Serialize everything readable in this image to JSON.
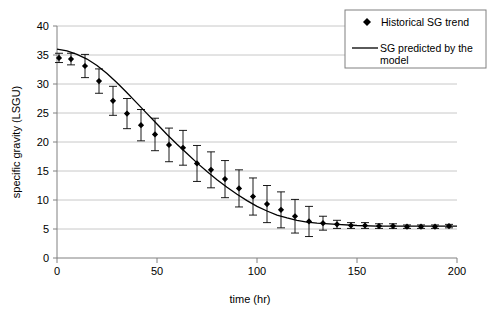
{
  "chart_data": {
    "type": "scatter",
    "title": "",
    "xlabel": "time (hr)",
    "ylabel": "specific gravity (LSGU)",
    "xlim": [
      0,
      200
    ],
    "ylim": [
      0,
      40
    ],
    "xticks": [
      0,
      50,
      100,
      150,
      200
    ],
    "yticks": [
      0,
      5,
      10,
      15,
      20,
      25,
      30,
      35,
      40
    ],
    "grid": "horizontal",
    "legend_position": "top-right",
    "series": [
      {
        "name": "Historical SG trend",
        "type": "scatter-with-errorbars",
        "marker": "diamond",
        "color": "#000000",
        "x": [
          1,
          7,
          14,
          21,
          28,
          35,
          42,
          49,
          56,
          63,
          70,
          77,
          84,
          91,
          98,
          105,
          112,
          119,
          126,
          133,
          140,
          147,
          154,
          161,
          168,
          175,
          182,
          189,
          196
        ],
        "y": [
          34.5,
          34.3,
          33.1,
          30.5,
          27.1,
          24.9,
          22.9,
          21.3,
          19.5,
          19.0,
          16.3,
          15.2,
          13.6,
          12.0,
          10.6,
          9.3,
          8.3,
          7.2,
          6.3,
          6.0,
          5.8,
          5.6,
          5.6,
          5.5,
          5.5,
          5.4,
          5.4,
          5.4,
          5.5
        ],
        "yerr": [
          0.8,
          1.0,
          2.0,
          2.1,
          2.5,
          2.6,
          2.7,
          2.8,
          2.9,
          3.0,
          3.1,
          3.1,
          3.2,
          3.2,
          3.2,
          3.2,
          3.1,
          2.9,
          2.6,
          1.2,
          0.7,
          0.5,
          0.5,
          0.4,
          0.4,
          0.3,
          0.3,
          0.3,
          0.3
        ]
      },
      {
        "name": "SG predicted by the model",
        "type": "line",
        "color": "#000000",
        "x": [
          0,
          5,
          10,
          15,
          20,
          25,
          30,
          35,
          40,
          45,
          50,
          55,
          60,
          65,
          70,
          75,
          80,
          85,
          90,
          95,
          100,
          105,
          110,
          115,
          120,
          125,
          130,
          140,
          150,
          160,
          170,
          180,
          190,
          200
        ],
        "y": [
          36.0,
          35.7,
          35.1,
          34.3,
          33.2,
          31.8,
          30.2,
          28.5,
          26.7,
          24.9,
          23.1,
          21.3,
          19.6,
          18.0,
          16.4,
          14.9,
          13.5,
          12.2,
          11.0,
          9.9,
          8.9,
          8.1,
          7.4,
          6.9,
          6.5,
          6.2,
          6.0,
          5.8,
          5.6,
          5.5,
          5.5,
          5.5,
          5.5,
          5.5
        ]
      }
    ]
  },
  "legend": {
    "items": [
      {
        "label": "Historical SG trend",
        "marker": "diamond"
      },
      {
        "label": "SG predicted by the\nmodel",
        "marker": "line"
      }
    ],
    "item1_label": "Historical SG trend",
    "item2_label_line1": "SG predicted by the",
    "item2_label_line2": "model"
  },
  "axes": {
    "y_title": "specific gravity (LSGU)",
    "x_title": "time (hr)",
    "y_tick_0": "0",
    "y_tick_1": "5",
    "y_tick_2": "10",
    "y_tick_3": "15",
    "y_tick_4": "20",
    "y_tick_5": "25",
    "y_tick_6": "30",
    "y_tick_7": "35",
    "y_tick_8": "40",
    "x_tick_0": "0",
    "x_tick_1": "50",
    "x_tick_2": "100",
    "x_tick_3": "150",
    "x_tick_4": "200"
  },
  "colors": {
    "gridline": "#c8c8c8",
    "axis": "#808080",
    "marker": "#000000",
    "line": "#000000",
    "legend_border": "#808080",
    "background": "#ffffff"
  }
}
